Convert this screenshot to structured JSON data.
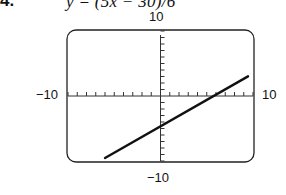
{
  "problem": {
    "number": "4.",
    "equation": "y = (5x − 30)/6"
  },
  "chart_data": {
    "type": "line",
    "title": "y = (5x − 30)/6",
    "xlabel": "",
    "ylabel": "",
    "xlim": [
      -10,
      10
    ],
    "ylim": [
      -10,
      10
    ],
    "tick_labels": {
      "xmin": "−10",
      "xmax": "10",
      "ymin": "−10",
      "ymax": "10"
    },
    "xscale": 1,
    "yscale": 1,
    "grid": false,
    "series": [
      {
        "name": "y = (5x − 30)/6",
        "x": [
          -6,
          0,
          6,
          10
        ],
        "y": [
          -10,
          -5,
          0,
          3.33
        ]
      }
    ],
    "line_color": "#111111"
  }
}
